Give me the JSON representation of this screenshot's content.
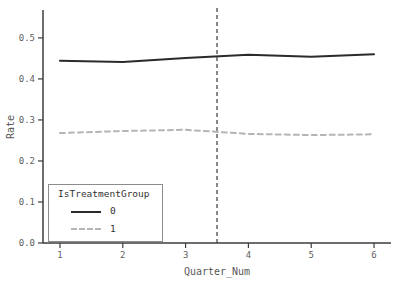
{
  "figure": {
    "background": "#ffffff",
    "width_px": 403,
    "height_px": 286
  },
  "legend": {
    "title": "IsTreatmentGroup",
    "position": "lower left",
    "entries": [
      {
        "label": "0",
        "style": "solid",
        "color": "#2b2b2b"
      },
      {
        "label": "1",
        "style": "dashed",
        "color": "#b5b5b5"
      }
    ]
  },
  "colors": {
    "spine": "#3c3c3c",
    "tick_label": "#606060",
    "axis_label": "#585858",
    "vline": "#4a4a4a",
    "series0": "#2b2b2b",
    "series1": "#b5b5b5"
  },
  "chart_data": {
    "type": "line",
    "title": "",
    "xlabel": "Quarter_Num",
    "ylabel": "Rate",
    "x": [
      1,
      2,
      3,
      4,
      5,
      6
    ],
    "series": [
      {
        "name": "0",
        "values": [
          0.444,
          0.441,
          0.451,
          0.459,
          0.454,
          0.46
        ],
        "color": "#2b2b2b",
        "dash": "solid",
        "width": 2
      },
      {
        "name": "1",
        "values": [
          0.268,
          0.273,
          0.276,
          0.266,
          0.263,
          0.265
        ],
        "color": "#b5b5b5",
        "dash": "dashed",
        "width": 2
      }
    ],
    "vline": {
      "x": 3.5,
      "color": "#4a4a4a",
      "style": "dashed"
    },
    "x_ticks": [
      {
        "label": "1",
        "value": 1
      },
      {
        "label": "2",
        "value": 2
      },
      {
        "label": "3",
        "value": 3
      },
      {
        "label": "4",
        "value": 4
      },
      {
        "label": "5",
        "value": 5
      },
      {
        "label": "6",
        "value": 6
      }
    ],
    "y_ticks": [
      {
        "label": "0.0",
        "value": 0.0
      },
      {
        "label": "0.1",
        "value": 0.1
      },
      {
        "label": "0.2",
        "value": 0.2
      },
      {
        "label": "0.3",
        "value": 0.3
      },
      {
        "label": "0.4",
        "value": 0.4
      },
      {
        "label": "0.5",
        "value": 0.5
      }
    ],
    "xlim": [
      0.73,
      6.27
    ],
    "ylim": [
      0,
      0.568
    ],
    "grid": false,
    "legend_position": "lower left"
  }
}
